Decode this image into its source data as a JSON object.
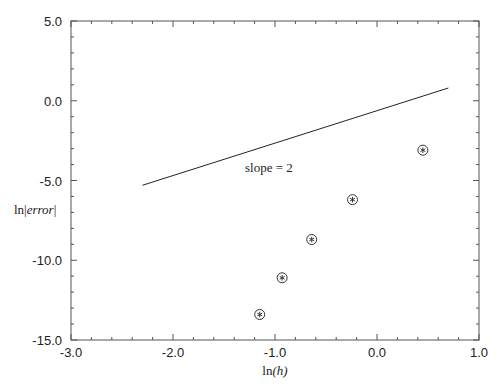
{
  "chart_data": {
    "type": "scatter",
    "title": "",
    "xlabel": "ln(h)",
    "xlabel_parts": {
      "prefix": "ln",
      "open": "(",
      "var": "h",
      "close": ")"
    },
    "ylabel": "ln|error|",
    "ylabel_parts": {
      "prefix": "ln|",
      "var": "error",
      "suffix": "|"
    },
    "xlim": [
      -3.0,
      1.0
    ],
    "ylim": [
      -15.0,
      5.0
    ],
    "x_ticks": [
      -3.0,
      -2.0,
      -1.0,
      0.0,
      1.0
    ],
    "x_tick_labels": [
      "-3.0",
      "-2.0",
      "-1.0",
      "0.0",
      "1.0"
    ],
    "y_ticks": [
      5.0,
      0.0,
      -5.0,
      -10.0,
      -15.0
    ],
    "y_tick_labels": [
      "5.0",
      "0.0",
      "-5.0",
      "-10.0",
      "-15.0"
    ],
    "x_minor_step": 0.2,
    "y_minor_step": 1.0,
    "grid": false,
    "legend": null,
    "series": [
      {
        "name": "error data",
        "marker": "circled-asterisk",
        "x": [
          -1.15,
          -0.93,
          -0.64,
          -0.24,
          0.45
        ],
        "y": [
          -13.4,
          -11.1,
          -8.7,
          -6.2,
          -3.1
        ]
      },
      {
        "name": "reference line slope 2",
        "style": "line",
        "x": [
          -2.3,
          0.7
        ],
        "y": [
          -5.3,
          0.8
        ]
      }
    ],
    "annotations": [
      {
        "text": "slope = 2",
        "x": -1.55,
        "y": -4.4
      }
    ],
    "colors": {
      "axis": "#555555",
      "line": "#222222",
      "marker": "#333333",
      "text": "#222222"
    }
  }
}
